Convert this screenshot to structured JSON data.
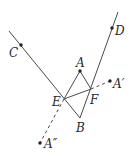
{
  "diagram": {
    "title": "",
    "points": {
      "C": {
        "label": "C",
        "x": 21,
        "y": 45
      },
      "D": {
        "label": "D",
        "x": 112,
        "y": 28
      },
      "A": {
        "label": "A",
        "x": 80,
        "y": 71
      },
      "E": {
        "label": "E",
        "x": 64,
        "y": 99
      },
      "F": {
        "label": "F",
        "x": 91,
        "y": 89
      },
      "B": {
        "label": "B",
        "x": 80,
        "y": 118
      },
      "A1": {
        "label": "A′",
        "x": 110,
        "y": 81
      },
      "A2": {
        "label": "A″",
        "x": 40,
        "y": 143
      }
    },
    "segments": [
      {
        "from": "line1-start",
        "to": "B",
        "style": "solid",
        "note": "line through C and E to B"
      },
      {
        "from": "line2-start",
        "to": "B",
        "style": "solid",
        "note": "line through D and F to B"
      },
      {
        "from": "A",
        "to": "E",
        "style": "solid"
      },
      {
        "from": "A",
        "to": "F",
        "style": "solid"
      },
      {
        "from": "E",
        "to": "F",
        "style": "solid"
      },
      {
        "from": "F",
        "to": "A1",
        "style": "dashed"
      },
      {
        "from": "E",
        "to": "A2",
        "style": "dashed"
      }
    ],
    "colors": {
      "line": "#4a4a4a",
      "point": "#222222",
      "text": "#2a2a2a"
    }
  }
}
